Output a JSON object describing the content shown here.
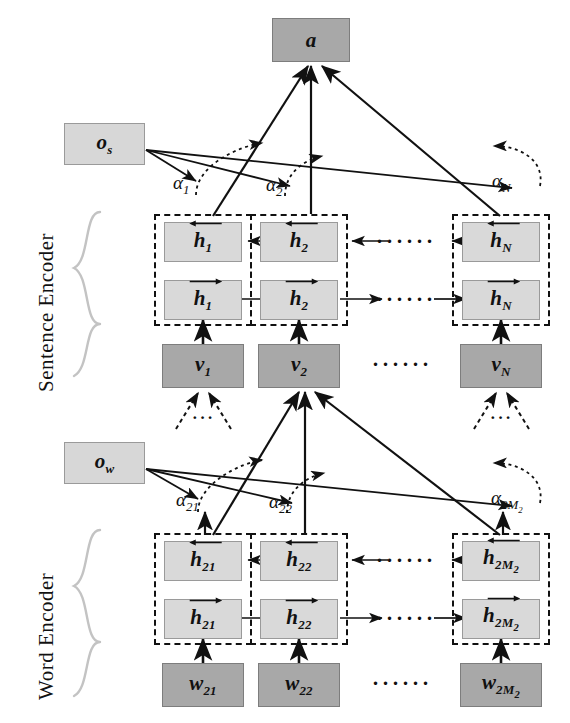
{
  "figure": {
    "type": "diagram",
    "side_labels": {
      "sentence_encoder": "Sentence Encoder",
      "word_encoder": "Word Encoder"
    },
    "output": {
      "label": "a",
      "shade": "dark"
    },
    "context_vectors": {
      "sentence": "o_s",
      "word": "o_w"
    },
    "sentence_level": {
      "attention_weights": [
        "α₁",
        "α₂",
        "α_N"
      ],
      "backward_states": [
        "h₁",
        "h₂",
        "h_N"
      ],
      "forward_states": [
        "h₁",
        "h₂",
        "h_N"
      ],
      "inputs": [
        "v₁",
        "v₂",
        "v_N"
      ],
      "ellipsis": "……"
    },
    "word_level": {
      "attention_weights": [
        "α₂₁",
        "α₂₂",
        "α_2M₂"
      ],
      "backward_states": [
        "h₂₁",
        "h₂₂",
        "h_2M₂"
      ],
      "forward_states": [
        "h₂₁",
        "h₂₂",
        "h_2M₂"
      ],
      "inputs": [
        "w₂₁",
        "w₂₂",
        "w_2M₂"
      ],
      "ellipsis": "……"
    },
    "colors": {
      "input_box_fill": "#a8a8a8",
      "state_box_fill": "#d9d9d9",
      "context_box_fill": "#d7d7d7",
      "output_box_fill": "#a8a8a8",
      "line": "#111111",
      "brace": "#c3c3c3"
    },
    "boxes": {
      "a": {
        "text": "a"
      },
      "os": {
        "base": "o",
        "sub": "s"
      },
      "ow": {
        "base": "o",
        "sub": "w"
      },
      "s_bwd_1": {
        "base": "h",
        "sub": "1"
      },
      "s_bwd_2": {
        "base": "h",
        "sub": "2"
      },
      "s_bwd_N": {
        "base": "h",
        "sub": "N"
      },
      "s_fwd_1": {
        "base": "h",
        "sub": "1"
      },
      "s_fwd_2": {
        "base": "h",
        "sub": "2"
      },
      "s_fwd_N": {
        "base": "h",
        "sub": "N"
      },
      "v1": {
        "base": "v",
        "sub": "1"
      },
      "v2": {
        "base": "v",
        "sub": "2"
      },
      "vN": {
        "base": "v",
        "sub": "N"
      },
      "w_bwd_1": {
        "base": "h",
        "sub": "21"
      },
      "w_bwd_2": {
        "base": "h",
        "sub": "22"
      },
      "w_bwd_M": {
        "base": "h",
        "sub": "2M",
        "sub2": "2"
      },
      "w_fwd_1": {
        "base": "h",
        "sub": "21"
      },
      "w_fwd_2": {
        "base": "h",
        "sub": "22"
      },
      "w_fwd_M": {
        "base": "h",
        "sub": "2M",
        "sub2": "2"
      },
      "w1": {
        "base": "w",
        "sub": "21"
      },
      "w2": {
        "base": "w",
        "sub": "22"
      },
      "wM": {
        "base": "w",
        "sub": "2M",
        "sub2": "2"
      }
    },
    "alphas": {
      "a1": {
        "base": "α",
        "sub": "1"
      },
      "a2": {
        "base": "α",
        "sub": "2"
      },
      "aN": {
        "base": "α",
        "sub": "N"
      },
      "a21": {
        "base": "α",
        "sub": "21"
      },
      "a22": {
        "base": "α",
        "sub": "22"
      },
      "a2M": {
        "base": "α",
        "sub": "2M",
        "sub2": "2"
      }
    },
    "ellipses": {
      "dots_wide": "······",
      "dots_small": "···"
    }
  }
}
